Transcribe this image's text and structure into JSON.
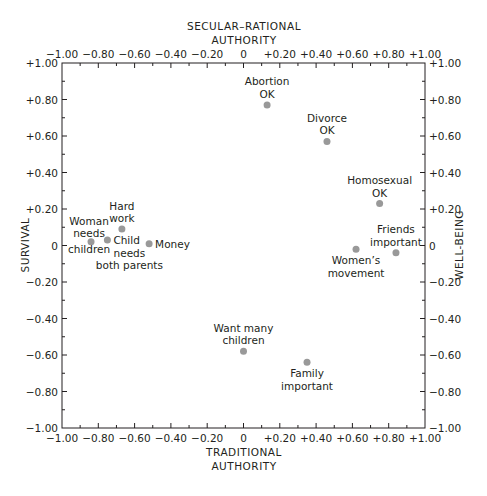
{
  "chart_data": {
    "type": "scatter",
    "title": "",
    "top_axis_title": [
      "SECULAR–RATIONAL",
      "AUTHORITY"
    ],
    "bottom_axis_title": [
      "TRADITIONAL",
      "AUTHORITY"
    ],
    "left_axis_title": "SURVIVAL",
    "right_axis_title": "WELL-BEING",
    "xlabel": "TRADITIONAL AUTHORITY ↔ SECULAR–RATIONAL AUTHORITY",
    "ylabel": "SURVIVAL ↔ WELL-BEING",
    "xlim": [
      -1.0,
      1.0
    ],
    "ylim": [
      -1.0,
      1.0
    ],
    "grid": false,
    "legend": null,
    "x_tick_labels": [
      "−1.00",
      "−0.80",
      "−0.60",
      "−0.40",
      "−0.20",
      "0",
      "+0.20",
      "+0.40",
      "+0.60",
      "+0.80",
      "+1.00"
    ],
    "y_tick_labels": [
      "+1.00",
      "+0.80",
      "+0.60",
      "+0.40",
      "+0.20",
      "0",
      "−0.20",
      "−0.40",
      "−0.60",
      "−0.80",
      "−1.00"
    ],
    "points": [
      {
        "label": [
          "Abortion",
          "OK"
        ],
        "x": 0.13,
        "y": 0.77,
        "label_pos": "above"
      },
      {
        "label": [
          "Divorce",
          "OK"
        ],
        "x": 0.46,
        "y": 0.57,
        "label_pos": "above"
      },
      {
        "label": [
          "Homosexual",
          "OK"
        ],
        "x": 0.75,
        "y": 0.23,
        "label_pos": "above"
      },
      {
        "label": [
          "Friends",
          "important"
        ],
        "x": 0.84,
        "y": -0.04,
        "label_pos": "above"
      },
      {
        "label": [
          "Women’s",
          "movement"
        ],
        "x": 0.62,
        "y": -0.02,
        "label_pos": "below"
      },
      {
        "label": [
          "Hard",
          "work"
        ],
        "x": -0.67,
        "y": 0.09,
        "label_pos": "above"
      },
      {
        "label": [
          "Woman",
          "needs",
          "children"
        ],
        "x": -0.84,
        "y": 0.02,
        "label_pos": "around"
      },
      {
        "label": [
          "Child",
          "needs",
          "both parents"
        ],
        "x": -0.75,
        "y": 0.03,
        "label_pos": "right"
      },
      {
        "label": [
          "Money"
        ],
        "x": -0.52,
        "y": 0.01,
        "label_pos": "right"
      },
      {
        "label": [
          "Want many",
          "children"
        ],
        "x": 0.0,
        "y": -0.58,
        "label_pos": "above"
      },
      {
        "label": [
          "Family",
          "important"
        ],
        "x": 0.35,
        "y": -0.64,
        "label_pos": "below"
      }
    ]
  }
}
